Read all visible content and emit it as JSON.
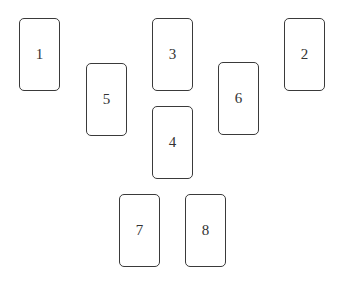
{
  "diagram": {
    "type": "card-spread-layout",
    "cards": [
      {
        "label": "1",
        "x": 19,
        "y": 18
      },
      {
        "label": "2",
        "x": 284,
        "y": 18
      },
      {
        "label": "3",
        "x": 152,
        "y": 18
      },
      {
        "label": "4",
        "x": 152,
        "y": 106
      },
      {
        "label": "5",
        "x": 86,
        "y": 63
      },
      {
        "label": "6",
        "x": 218,
        "y": 62
      },
      {
        "label": "7",
        "x": 119,
        "y": 194
      },
      {
        "label": "8",
        "x": 185,
        "y": 194
      }
    ]
  }
}
